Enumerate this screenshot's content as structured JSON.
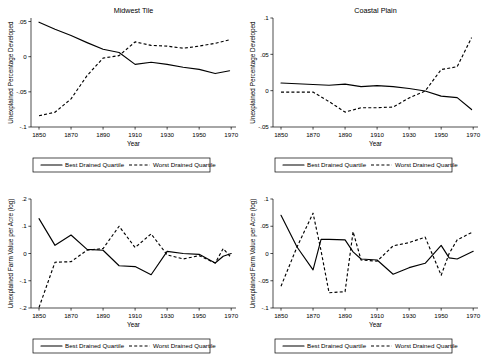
{
  "figure": {
    "panels": [
      "midwest-tile-pct",
      "coastal-plain-pct",
      "midwest-tile-value",
      "coastal-plain-value"
    ]
  },
  "legend": {
    "best_label": "Best Drained Quartile",
    "worst_label": "Worst Drained Quartile"
  },
  "chart_data": [
    {
      "id": "midwest-tile-pct",
      "type": "line",
      "title": "Midwest Tile",
      "xlabel": "Year",
      "ylabel": "Unexplained Percentage Developed",
      "xlim": [
        1845,
        1973
      ],
      "ylim": [
        -0.1,
        0.055
      ],
      "xticks": [
        1850,
        1870,
        1890,
        1910,
        1930,
        1950,
        1970
      ],
      "xticklabels": [
        "1850",
        "1870",
        "1890",
        "1910",
        "1930",
        "1950",
        "1970"
      ],
      "yticks": [
        0.05,
        0,
        -0.05,
        -0.1
      ],
      "yticklabels": [
        ".05",
        "0",
        "-.05",
        "-.1"
      ],
      "grid": false,
      "legend_position": "below",
      "x": [
        1850,
        1860,
        1870,
        1880,
        1890,
        1900,
        1910,
        1920,
        1930,
        1940,
        1950,
        1960,
        1969
      ],
      "series": [
        {
          "name": "Best Drained Quartile",
          "style": "solid",
          "values": [
            0.049,
            0.039,
            0.03,
            0.02,
            0.0105,
            0.006,
            -0.011,
            -0.008,
            -0.011,
            -0.015,
            -0.018,
            -0.024,
            -0.02
          ]
        },
        {
          "name": "Worst Drained Quartile",
          "style": "dashed",
          "values": [
            -0.084,
            -0.079,
            -0.06,
            -0.027,
            -0.002,
            0.0015,
            0.021,
            0.016,
            0.015,
            0.012,
            0.015,
            0.019,
            0.024
          ]
        }
      ]
    },
    {
      "id": "coastal-plain-pct",
      "type": "line",
      "title": "Coastal Plain",
      "xlabel": "Year",
      "ylabel": "Unexplained Percentage Developed",
      "xlim": [
        1845,
        1973
      ],
      "ylim": [
        -0.05,
        0.1
      ],
      "xticks": [
        1850,
        1870,
        1890,
        1910,
        1930,
        1950,
        1970
      ],
      "xticklabels": [
        "1850",
        "1870",
        "1890",
        "1910",
        "1930",
        "1950",
        "1970"
      ],
      "yticks": [
        0.1,
        0.05,
        0,
        -0.05
      ],
      "yticklabels": [
        ".1",
        ".05",
        "0",
        "-.05"
      ],
      "grid": false,
      "legend_position": "below",
      "x": [
        1850,
        1860,
        1870,
        1880,
        1890,
        1900,
        1910,
        1920,
        1930,
        1940,
        1950,
        1960,
        1969
      ],
      "series": [
        {
          "name": "Best Drained Quartile",
          "style": "solid",
          "values": [
            0.0105,
            0.0095,
            0.0085,
            0.0075,
            0.009,
            0.0055,
            0.007,
            0.0055,
            0.003,
            -0.0005,
            -0.0075,
            -0.0095,
            -0.026
          ]
        },
        {
          "name": "Worst Drained Quartile",
          "style": "dashed",
          "values": [
            -0.002,
            -0.002,
            -0.002,
            -0.015,
            -0.0295,
            -0.0235,
            -0.0235,
            -0.0225,
            -0.01,
            -0.0005,
            0.029,
            0.033,
            0.073
          ]
        }
      ]
    },
    {
      "id": "midwest-tile-value",
      "type": "line",
      "title": "",
      "xlabel": "Year",
      "ylabel": "Unexplained Farm Value per Acre (log)",
      "xlim": [
        1845,
        1973
      ],
      "ylim": [
        -0.2,
        0.2
      ],
      "xticks": [
        1850,
        1870,
        1890,
        1910,
        1930,
        1950,
        1970
      ],
      "xticklabels": [
        "1850",
        "1870",
        "1890",
        "1910",
        "1930",
        "1950",
        "1970"
      ],
      "yticks": [
        0.2,
        0.1,
        0,
        -0.1,
        -0.2
      ],
      "yticklabels": [
        ".2",
        ".1",
        "0",
        "-.1",
        "-.2"
      ],
      "grid": false,
      "legend_position": "below",
      "x": [
        1850,
        1860,
        1870,
        1880,
        1890,
        1900,
        1910,
        1920,
        1930,
        1940,
        1950,
        1960,
        1965,
        1970
      ],
      "series": [
        {
          "name": "Best Drained Quartile",
          "style": "solid",
          "values": [
            0.128,
            0.03,
            0.068,
            0.015,
            0.012,
            -0.045,
            -0.048,
            -0.078,
            0.008,
            0.0,
            -0.003,
            -0.035,
            -0.01,
            0.0
          ]
        },
        {
          "name": "Worst Drained Quartile",
          "style": "dashed",
          "values": [
            -0.198,
            -0.032,
            -0.03,
            0.012,
            0.018,
            0.1,
            0.022,
            0.072,
            -0.005,
            -0.02,
            -0.008,
            -0.035,
            0.018,
            -0.015
          ]
        }
      ]
    },
    {
      "id": "coastal-plain-value",
      "type": "line",
      "title": "",
      "xlabel": "Year",
      "ylabel": "Unexplained Farm Value per Acre (log)",
      "xlim": [
        1845,
        1973
      ],
      "ylim": [
        -0.1,
        0.1
      ],
      "xticks": [
        1850,
        1870,
        1890,
        1910,
        1930,
        1950,
        1970
      ],
      "xticklabels": [
        "1850",
        "1870",
        "1890",
        "1910",
        "1930",
        "1950",
        "1970"
      ],
      "yticks": [
        0.1,
        0.05,
        0,
        -0.05,
        -0.1
      ],
      "yticklabels": [
        ".1",
        ".05",
        "0",
        "-.05",
        "-.1"
      ],
      "grid": false,
      "legend_position": "below",
      "x": [
        1850,
        1860,
        1870,
        1875,
        1880,
        1890,
        1895,
        1900,
        1910,
        1920,
        1930,
        1940,
        1950,
        1955,
        1960,
        1970
      ],
      "series": [
        {
          "name": "Best Drained Quartile",
          "style": "solid",
          "values": [
            0.07,
            0.012,
            -0.03,
            0.026,
            0.026,
            0.025,
            0.003,
            -0.01,
            -0.012,
            -0.038,
            -0.026,
            -0.018,
            0.015,
            -0.008,
            -0.01,
            0.004
          ]
        },
        {
          "name": "Worst Drained Quartile",
          "style": "dashed",
          "values": [
            -0.06,
            0.012,
            0.074,
            0.005,
            -0.072,
            -0.07,
            0.04,
            -0.012,
            -0.014,
            0.014,
            0.02,
            0.03,
            -0.04,
            0.0,
            0.025,
            0.04
          ]
        }
      ]
    }
  ]
}
